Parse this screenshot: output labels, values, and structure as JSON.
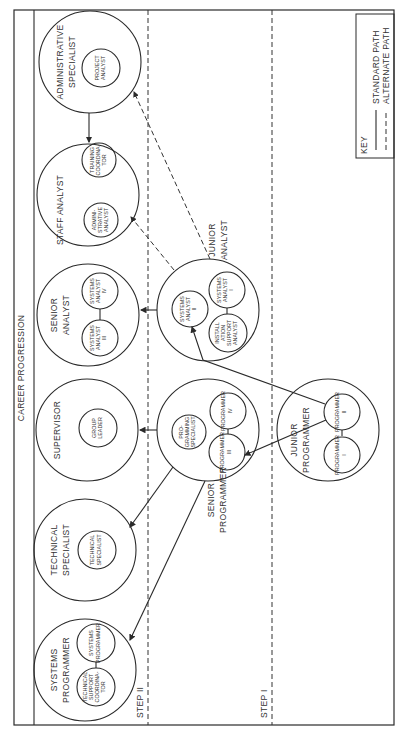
{
  "title": "CAREER PROGRESSION",
  "steps": [
    "STEP II",
    "STEP I"
  ],
  "key": {
    "title": "KEY",
    "standard": "STANDARD PATH",
    "alternate": "ALTERNATE PATH"
  },
  "groups": {
    "administrative_specialist": {
      "label": "ADMINISTRATIVE SPECIALIST",
      "line1": "ADMINISTRATIVE",
      "line2": "SPECIALIST",
      "roles": [
        [
          "PROJECT",
          "ANALYST"
        ]
      ]
    },
    "staff_analyst": {
      "label": "STAFF ANALYST",
      "roles": [
        [
          "TRAINING",
          "COORDINA-",
          "TOR"
        ],
        [
          "ADMINI-",
          "STRATIVE",
          "ANALYST"
        ]
      ]
    },
    "senior_analyst": {
      "label": "SENIOR ANALYST",
      "line1": "SENIOR",
      "line2": "ANALYST",
      "roles": [
        [
          "SYSTEMS",
          "ANALYST",
          "IV"
        ],
        [
          "SYSTEMS",
          "ANALYST",
          "III"
        ]
      ]
    },
    "junior_analyst": {
      "label": "JUNIOR ANALYST",
      "line1": "JUNIOR",
      "line2": "ANALYST",
      "roles": [
        [
          "SYSTEMS",
          "ANALYST",
          "II"
        ],
        [
          "SYSTEMS",
          "ANALYST",
          "I"
        ],
        [
          "INSTALL",
          "ATION",
          "SUPPORT",
          "ANALYST"
        ]
      ]
    },
    "supervisor": {
      "label": "SUPERVISOR",
      "roles": [
        [
          "GROUP",
          "LEADER"
        ]
      ]
    },
    "senior_programmer": {
      "label": "SENIOR PROGRAMMER",
      "line1": "SENIOR",
      "line2": "PROGRAMMER",
      "roles": [
        [
          "PRO-",
          "GRAMMING",
          "SPECIALIST"
        ],
        [
          "PROGRAMMER",
          "IV"
        ],
        [
          "PROGRAMMER",
          "III"
        ]
      ]
    },
    "junior_programmer": {
      "label": "JUNIOR PROGRAMMER",
      "line1": "JUNIOR",
      "line2": "PROGRAMMER",
      "roles": [
        [
          "PROGRAMMER",
          "II"
        ],
        [
          "PROGRAMMER",
          "I"
        ]
      ]
    },
    "technical_specialist": {
      "label": "TECHNICAL SPECIALIST",
      "line1": "TECHNICAL",
      "line2": "SPECIALIST",
      "roles": [
        [
          "TECHNICAL",
          "SPECIALIST"
        ]
      ]
    },
    "systems_programmer": {
      "label": "SYSTEMS PROGRAMMER",
      "line1": "SYSTEMS",
      "line2": "PROGRAMMER",
      "roles": [
        [
          "SYSTEMS",
          "PROGRAMMER"
        ],
        [
          "TECHNICAL",
          "SUPPORT",
          "COORDINA-",
          "TOR"
        ]
      ]
    }
  },
  "paths": [
    {
      "from": "Programmer II",
      "to": "Systems Analyst II",
      "type": "standard"
    },
    {
      "from": "Programmer II",
      "to": "Programmer III",
      "type": "standard"
    },
    {
      "from": "Junior Analyst",
      "to": "Senior Analyst",
      "type": "standard"
    },
    {
      "from": "Senior Programmer",
      "to": "Supervisor",
      "type": "standard"
    },
    {
      "from": "Senior Programmer",
      "to": "Technical Specialist",
      "type": "standard"
    },
    {
      "from": "Senior Programmer",
      "to": "Systems Programmer",
      "type": "standard"
    },
    {
      "from": "Administrative Specialist",
      "to": "Staff Analyst",
      "type": "standard"
    },
    {
      "from": "Junior Analyst",
      "to": "Staff Analyst",
      "type": "alternate"
    },
    {
      "from": "Junior Analyst",
      "to": "Administrative Specialist",
      "type": "alternate"
    }
  ]
}
